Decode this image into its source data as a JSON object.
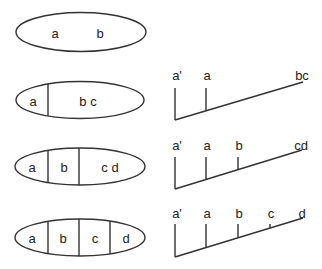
{
  "diagram": {
    "type": "partition-and-cladogram",
    "rows": [
      {
        "ellipse": {
          "cx": 81,
          "cy": 32,
          "rx": 65,
          "ry": 19.5,
          "dividers": [],
          "labels": [
            {
              "text": "a",
              "x": 55
            },
            {
              "text": "b",
              "x": 100
            }
          ]
        },
        "tree": null
      },
      {
        "ellipse": {
          "cx": 80,
          "cy": 100,
          "rx": 64,
          "ry": 18.5,
          "dividers": [
            48
          ],
          "labels": [
            {
              "text": "a",
              "x": 33
            },
            {
              "text": "b  c",
              "x": 88
            }
          ]
        },
        "tree": {
          "root": [
            175,
            120
          ],
          "end": [
            303,
            82
          ],
          "top": 88,
          "label_y": 75,
          "branches": [
            {
              "label": "a'",
              "x": 175
            },
            {
              "label": "a",
              "x": 206
            },
            {
              "label": "bc",
              "x": 303
            }
          ]
        }
      },
      {
        "ellipse": {
          "cx": 80,
          "cy": 166.5,
          "rx": 65,
          "ry": 18.5,
          "dividers": [
            48,
            79
          ],
          "labels": [
            {
              "text": "a",
              "x": 32
            },
            {
              "text": "b",
              "x": 64
            },
            {
              "text": "c d",
              "x": 110
            }
          ]
        },
        "tree": {
          "root": [
            175,
            189
          ],
          "end": [
            302,
            150
          ],
          "top": 157,
          "label_y": 145,
          "branches": [
            {
              "label": "a'",
              "x": 175
            },
            {
              "label": "a",
              "x": 206
            },
            {
              "label": "b",
              "x": 238
            },
            {
              "label": "cd",
              "x": 302
            }
          ]
        }
      },
      {
        "ellipse": {
          "cx": 80,
          "cy": 237.5,
          "rx": 65,
          "ry": 18.5,
          "dividers": [
            48,
            79,
            110
          ],
          "labels": [
            {
              "text": "a",
              "x": 32
            },
            {
              "text": "b",
              "x": 63
            },
            {
              "text": "c",
              "x": 95
            },
            {
              "text": "d",
              "x": 126
            }
          ]
        },
        "tree": {
          "root": [
            175,
            257
          ],
          "end": [
            303,
            218
          ],
          "top": 224,
          "label_y": 213,
          "branches": [
            {
              "label": "a'",
              "x": 175
            },
            {
              "label": "a",
              "x": 206
            },
            {
              "label": "b",
              "x": 238
            },
            {
              "label": "c",
              "x": 270
            },
            {
              "label": "d",
              "x": 303
            }
          ]
        }
      }
    ],
    "colors": {
      "stroke": "#333333",
      "text": "#222222",
      "background": "#ffffff"
    }
  }
}
